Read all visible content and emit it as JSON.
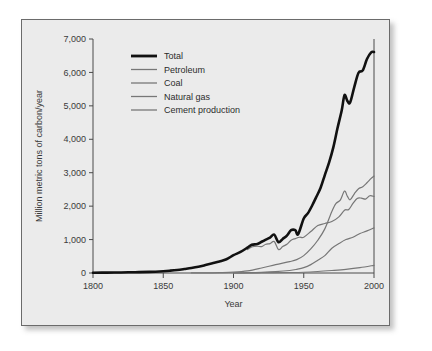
{
  "figure": {
    "background_color": "#ebebeb",
    "border_color": "#6b6b6b"
  },
  "chart_data": {
    "type": "line",
    "title": "",
    "xlabel": "Year",
    "ylabel": "Million metric tons of carbon/year",
    "xlim": [
      1800,
      2000
    ],
    "ylim": [
      0,
      7000
    ],
    "xticks": [
      1800,
      1850,
      1900,
      1950,
      2000
    ],
    "xtick_labels": [
      "1800",
      "1850",
      "1900",
      "1950",
      "2000"
    ],
    "yticks": [
      0,
      1000,
      2000,
      3000,
      4000,
      5000,
      6000,
      7000
    ],
    "ytick_labels": [
      "0",
      "1,000",
      "2,000",
      "3,000",
      "4,000",
      "5,000",
      "6,000",
      "7,000"
    ],
    "grid": false,
    "legend_position": "top-left",
    "series": [
      {
        "name": "Total",
        "color": "#111111",
        "width": 2.6,
        "x": [
          1800,
          1810,
          1820,
          1830,
          1840,
          1850,
          1855,
          1860,
          1865,
          1870,
          1875,
          1880,
          1885,
          1890,
          1895,
          1900,
          1905,
          1910,
          1913,
          1917,
          1920,
          1923,
          1926,
          1929,
          1932,
          1935,
          1938,
          1941,
          1944,
          1946,
          1950,
          1953,
          1956,
          1959,
          1962,
          1965,
          1968,
          1971,
          1974,
          1977,
          1979,
          1981,
          1983,
          1986,
          1989,
          1992,
          1995,
          1998,
          2000
        ],
        "y": [
          8,
          12,
          17,
          24,
          33,
          54,
          70,
          91,
          118,
          147,
          185,
          236,
          290,
          346,
          410,
          534,
          630,
          760,
          843,
          865,
          935,
          1000,
          1060,
          1145,
          920,
          1020,
          1120,
          1280,
          1280,
          1160,
          1630,
          1790,
          2020,
          2280,
          2550,
          2930,
          3300,
          3750,
          4330,
          4860,
          5320,
          5150,
          5100,
          5570,
          5990,
          6060,
          6400,
          6600,
          6610
        ]
      },
      {
        "name": "Petroleum",
        "color": "#777777",
        "width": 1.2,
        "x": [
          1870,
          1880,
          1890,
          1900,
          1910,
          1920,
          1930,
          1940,
          1945,
          1950,
          1955,
          1960,
          1965,
          1970,
          1973,
          1976,
          1979,
          1981,
          1983,
          1986,
          1989,
          1992,
          1995,
          1998,
          2000
        ],
        "y": [
          1,
          4,
          10,
          24,
          64,
          150,
          250,
          340,
          400,
          520,
          720,
          980,
          1320,
          1840,
          2080,
          2180,
          2450,
          2300,
          2190,
          2370,
          2520,
          2580,
          2700,
          2830,
          2900
        ]
      },
      {
        "name": "Coal",
        "color": "#777777",
        "width": 1.2,
        "x": [
          1910,
          1913,
          1917,
          1920,
          1923,
          1926,
          1929,
          1932,
          1935,
          1938,
          1941,
          1944,
          1947,
          1950,
          1955,
          1960,
          1965,
          1970,
          1975,
          1979,
          1982,
          1985,
          1988,
          1991,
          1994,
          1997,
          2000
        ],
        "y": [
          700,
          780,
          800,
          790,
          860,
          880,
          940,
          700,
          790,
          860,
          980,
          1030,
          1070,
          1070,
          1240,
          1420,
          1480,
          1540,
          1680,
          1880,
          1900,
          2080,
          2230,
          2240,
          2210,
          2310,
          2290
        ]
      },
      {
        "name": "Natural gas",
        "color": "#777777",
        "width": 1.2,
        "x": [
          1900,
          1910,
          1920,
          1930,
          1940,
          1945,
          1950,
          1955,
          1960,
          1965,
          1970,
          1975,
          1980,
          1985,
          1990,
          1995,
          2000
        ],
        "y": [
          3,
          9,
          20,
          40,
          75,
          110,
          160,
          250,
          380,
          520,
          740,
          880,
          1000,
          1070,
          1180,
          1260,
          1350
        ]
      },
      {
        "name": "Cement production",
        "color": "#777777",
        "width": 1.2,
        "x": [
          1900,
          1920,
          1940,
          1950,
          1960,
          1970,
          1980,
          1990,
          2000
        ],
        "y": [
          3,
          9,
          15,
          23,
          45,
          75,
          110,
          160,
          230
        ]
      }
    ]
  },
  "legend": {
    "items": [
      {
        "label": "Total"
      },
      {
        "label": "Petroleum"
      },
      {
        "label": "Coal"
      },
      {
        "label": "Natural gas"
      },
      {
        "label": "Cement production"
      }
    ]
  }
}
